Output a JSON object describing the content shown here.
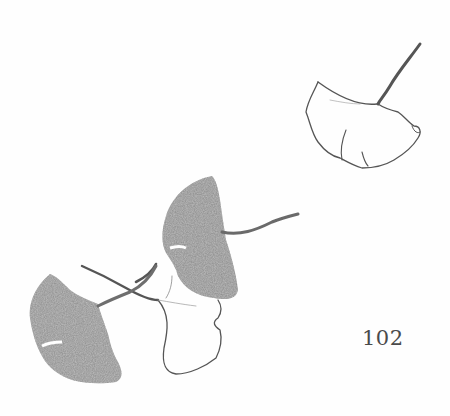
{
  "page": {
    "number": "102",
    "background": "#fefefe",
    "ink_color": "#555555",
    "shade_color": "#8a8a8a"
  },
  "illustration": {
    "subject": "ginkgo leaves",
    "leaves": [
      {
        "id": "outline-top-right",
        "style": "outline"
      },
      {
        "id": "shaded-middle",
        "style": "shaded"
      },
      {
        "id": "outline-middle",
        "style": "outline"
      },
      {
        "id": "shaded-bottom-left",
        "style": "shaded"
      }
    ]
  }
}
